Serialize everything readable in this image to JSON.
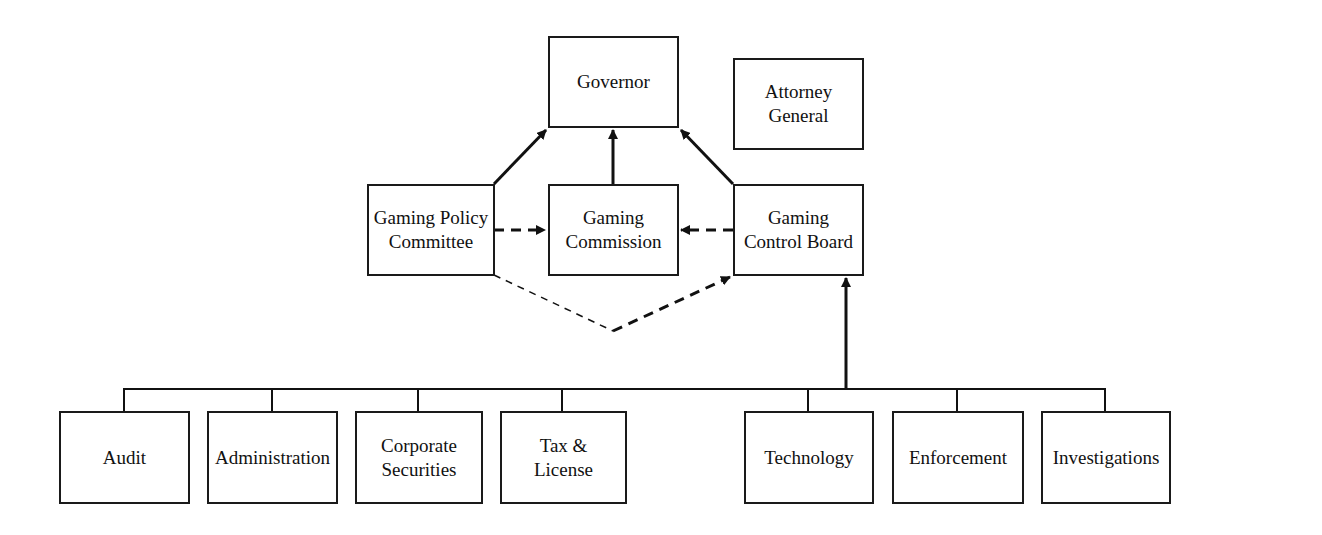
{
  "nodes": {
    "governor": "Governor",
    "attorney_general": "Attorney General",
    "gaming_policy_committee": "Gaming Policy Committee",
    "gaming_commission": "Gaming Commission",
    "gaming_control_board": "Gaming Control Board",
    "audit": "Audit",
    "administration": "Administration",
    "corporate_securities": "Corporate Securities",
    "tax_license": "Tax & License",
    "technology": "Technology",
    "enforcement": "Enforcement",
    "investigations": "Investigations"
  },
  "edges": [
    {
      "from": "gaming_policy_committee",
      "to": "governor",
      "style": "solid"
    },
    {
      "from": "gaming_commission",
      "to": "governor",
      "style": "solid"
    },
    {
      "from": "gaming_control_board",
      "to": "governor",
      "style": "solid"
    },
    {
      "from": "gaming_policy_committee",
      "to": "gaming_commission",
      "style": "dashed"
    },
    {
      "from": "gaming_control_board",
      "to": "gaming_commission",
      "style": "dashed"
    },
    {
      "from": "gaming_policy_committee",
      "to": "gaming_control_board",
      "style": "dashed"
    },
    {
      "from": "divisions",
      "to": "gaming_control_board",
      "style": "solid"
    }
  ]
}
